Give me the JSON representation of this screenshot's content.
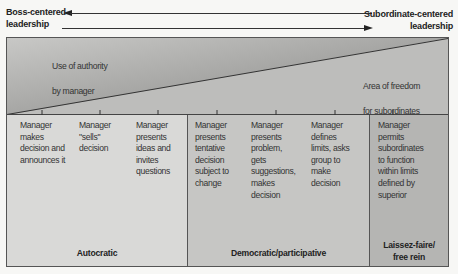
{
  "header": {
    "left_label": "Boss-centered\nleadership",
    "left_label_line1": "Boss-centered",
    "left_label_line2": "leadership",
    "right_label_line1": "Subordinate-centered",
    "right_label_line2": "leadership"
  },
  "continuum": {
    "authority_label_line1": "Use of authority",
    "authority_label_line2": "by manager",
    "freedom_label_line1": "Area of freedom",
    "freedom_label_line2": "for subordinates",
    "colors": {
      "authority_dark": "#8a8a88",
      "authority_light": "#c4c4c2",
      "freedom": "#b9b9b7",
      "line": "#333333"
    },
    "tick_positions": [
      35,
      93,
      151,
      210,
      269,
      328,
      386
    ]
  },
  "behaviors": [
    {
      "text": "Manager\nmakes\ndecision and\nannounces it"
    },
    {
      "text": "Manager\n\"sells\"\ndecision"
    },
    {
      "text": "Manager\npresents\nideas and\ninvites\nquestions"
    },
    {
      "text": "Manager\npresents\ntentative\ndecision\nsubject to\nchange"
    },
    {
      "text": "Manager\npresents\nproblem,\ngets\nsuggestions,\nmakes\ndecision"
    },
    {
      "text": "Manager\ndefines\nlimits, asks\ngroup to\nmake\ndecision"
    },
    {
      "text": "Manager\npermits\nsubordinates\nto function\nwithin limits\ndefined by\nsuperior"
    }
  ],
  "sections": [
    {
      "title": "Autocratic",
      "color": "#d9d9d7"
    },
    {
      "title": "Democratic/participative",
      "color": "#c6c6c4"
    },
    {
      "title": "Laissez-faire/\nfree  rein",
      "color": "#b5b5b3"
    }
  ]
}
